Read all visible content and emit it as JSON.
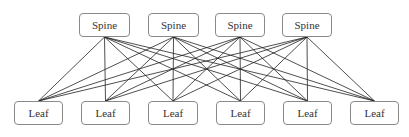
{
  "diagram": {
    "spines": [
      {
        "label": "Spine",
        "x": 79,
        "y": 13,
        "w": 51,
        "h": 24
      },
      {
        "label": "Spine",
        "x": 148,
        "y": 13,
        "w": 51,
        "h": 24
      },
      {
        "label": "Spine",
        "x": 215,
        "y": 13,
        "w": 50,
        "h": 24
      },
      {
        "label": "Spine",
        "x": 282,
        "y": 13,
        "w": 50,
        "h": 24
      }
    ],
    "leaves": [
      {
        "label": "Leaf",
        "x": 14,
        "y": 101,
        "w": 49,
        "h": 24
      },
      {
        "label": "Leaf",
        "x": 81,
        "y": 101,
        "w": 49,
        "h": 24
      },
      {
        "label": "Leaf",
        "x": 148,
        "y": 101,
        "w": 50,
        "h": 24
      },
      {
        "label": "Leaf",
        "x": 216,
        "y": 101,
        "w": 49,
        "h": 24
      },
      {
        "label": "Leaf",
        "x": 283,
        "y": 101,
        "w": 49,
        "h": 24
      },
      {
        "label": "Leaf",
        "x": 350,
        "y": 101,
        "w": 49,
        "h": 24
      }
    ],
    "topology": "full-mesh spine-leaf"
  }
}
